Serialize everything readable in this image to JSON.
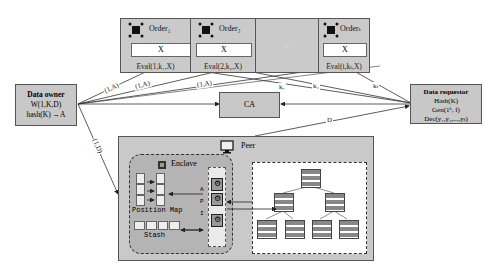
{
  "orders": [
    {
      "title": "Order₁",
      "input": "X",
      "eval": "Eval(1,k₁,X)"
    },
    {
      "title": "Order₂",
      "input": "X",
      "eval": "Eval(2,k₂,X)"
    },
    {
      "title": "...",
      "input": "",
      "eval": ""
    },
    {
      "title": "Orderₜ",
      "input": "X",
      "eval": "Eval(t,kₜ,X)"
    }
  ],
  "data_owner": {
    "title": "Data owner",
    "line1": "W(1,K,D)",
    "line2": "hash(K) →A"
  },
  "data_requestor": {
    "title": "Data requestor",
    "line1": "Hash(K)",
    "line2": "Gen(1ᵏ, f)",
    "line3": "Dec(y₁,y₂,...,yₜ)"
  },
  "ca": {
    "label": "CA"
  },
  "peer": {
    "label": "Peer"
  },
  "enclave": {
    "label": "Enclave",
    "position_map": "Position Map",
    "stash": "Stash",
    "api": [
      "A",
      "P",
      "I"
    ]
  },
  "edge_labels": {
    "owner_to_order1": "(1,A)",
    "owner_to_order2": "(1,A)",
    "owner_to_ordert": "(1,A)",
    "owner_to_peer": "(1,D)",
    "req_to_order1": "k₁",
    "req_to_order2": "k₂",
    "req_to_ordert": "kₜ",
    "peer_to_req": "D"
  }
}
